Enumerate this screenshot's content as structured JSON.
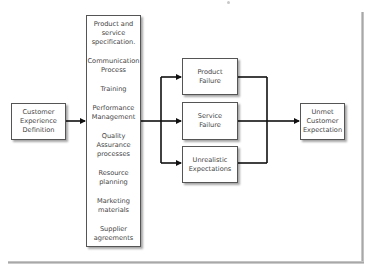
{
  "diagram": {
    "source_box": {
      "label": "Customer\nExperience\nDefinition",
      "lines": [
        "Customer",
        "Experience",
        "Definition"
      ]
    },
    "drivers_box": {
      "items": [
        {
          "lines": [
            "Product and",
            "service",
            "specification."
          ]
        },
        {
          "lines": [
            "Communication",
            "Process"
          ]
        },
        {
          "lines": [
            "Training"
          ]
        },
        {
          "lines": [
            "Performance",
            "Management"
          ]
        },
        {
          "lines": [
            "Quality",
            "Assurance",
            "processes"
          ]
        },
        {
          "lines": [
            "Resource",
            "planning"
          ]
        },
        {
          "lines": [
            "Marketing",
            "materials"
          ]
        },
        {
          "lines": [
            "Supplier",
            "agreements"
          ]
        }
      ]
    },
    "failure_boxes": [
      {
        "lines": [
          "Product",
          "Failure"
        ]
      },
      {
        "lines": [
          "Service",
          "Failure"
        ]
      },
      {
        "lines": [
          "Unrealistic",
          "Expectations"
        ]
      }
    ],
    "outcome_box": {
      "lines": [
        "Unmet",
        "Customer",
        "Expectation"
      ]
    },
    "colors": {
      "line": "#111111",
      "box_border": "#555555",
      "text": "#444444",
      "shadow": "#a8a8a8"
    }
  }
}
